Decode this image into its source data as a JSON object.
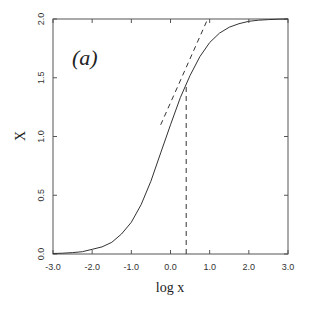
{
  "chart_data": {
    "type": "line",
    "title": "",
    "panel_label": "(a)",
    "xlabel": "log x",
    "ylabel": "X",
    "xlim": [
      -3.0,
      3.0
    ],
    "ylim": [
      0.0,
      2.0
    ],
    "x_ticks": [
      -3.0,
      -2.0,
      -1.0,
      0.0,
      1.0,
      2.0,
      3.0
    ],
    "x_tick_labels": [
      "-3.0",
      "-2.0",
      "-1.0",
      "0.0",
      "1.0",
      "2.0",
      "3.0"
    ],
    "y_ticks": [
      0.0,
      0.5,
      1.0,
      1.5,
      2.0
    ],
    "y_tick_labels": [
      "0.0",
      "0.5",
      "1.0",
      "1.5",
      "2.0"
    ],
    "grid": false,
    "legend": null,
    "series": [
      {
        "name": "X(log x)",
        "style": "solid",
        "x": [
          -3.0,
          -2.75,
          -2.5,
          -2.25,
          -2.0,
          -1.75,
          -1.5,
          -1.25,
          -1.0,
          -0.75,
          -0.5,
          -0.25,
          0.0,
          0.25,
          0.5,
          0.75,
          1.0,
          1.25,
          1.5,
          1.75,
          2.0,
          2.25,
          2.5,
          2.75,
          3.0
        ],
        "y": [
          0.004,
          0.007,
          0.012,
          0.02,
          0.04,
          0.06,
          0.1,
          0.17,
          0.27,
          0.42,
          0.62,
          0.86,
          1.1,
          1.33,
          1.52,
          1.68,
          1.8,
          1.88,
          1.93,
          1.96,
          1.98,
          1.99,
          1.995,
          1.998,
          2.0
        ]
      },
      {
        "name": "tangent",
        "style": "dashed",
        "x": [
          -0.25,
          0.95
        ],
        "y": [
          1.1,
          2.0
        ]
      },
      {
        "name": "vertical marker",
        "style": "dashed",
        "x": [
          0.4,
          0.4
        ],
        "y": [
          0.0,
          1.43
        ]
      }
    ]
  }
}
